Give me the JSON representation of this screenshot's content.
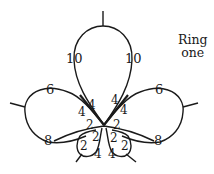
{
  "title": {
    "line1": "Ring",
    "line2": "one"
  },
  "rings": {
    "top": {
      "left_count": "10",
      "right_count": "10"
    },
    "left": {
      "top_count": "6",
      "bottom_count": "8",
      "inner_top": "4",
      "inner_bottom": "4"
    },
    "right": {
      "top_count": "6",
      "bottom_count": "8",
      "inner_top": "4",
      "inner_bottom": "4"
    },
    "bottom_left": {
      "outer": "2",
      "inner": "2",
      "side": "2",
      "bottom": "4"
    },
    "bottom_right": {
      "outer": "2",
      "inner": "2",
      "side": "2",
      "bottom": "4"
    }
  },
  "colors": {
    "ink": "#1a1a1a",
    "background": "#ffffff"
  }
}
